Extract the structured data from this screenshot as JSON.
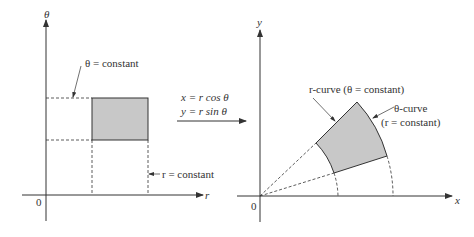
{
  "left_plot": {
    "vertical_axis_label": "θ",
    "horizontal_axis_label": "r",
    "origin_label": "0",
    "theta_const_label": "θ = constant",
    "r_const_label": "r = constant"
  },
  "transform": {
    "line1": "x = r cos θ",
    "line2": "y = r sin θ"
  },
  "right_plot": {
    "vertical_axis_label": "y",
    "horizontal_axis_label": "x",
    "origin_label": "0",
    "r_curve_label": "r-curve (θ = constant)",
    "theta_curve_label_1": "θ-curve",
    "theta_curve_label_2": "(r = constant)"
  },
  "colors": {
    "ink": "#333333",
    "fill": "#c8c8c8"
  }
}
